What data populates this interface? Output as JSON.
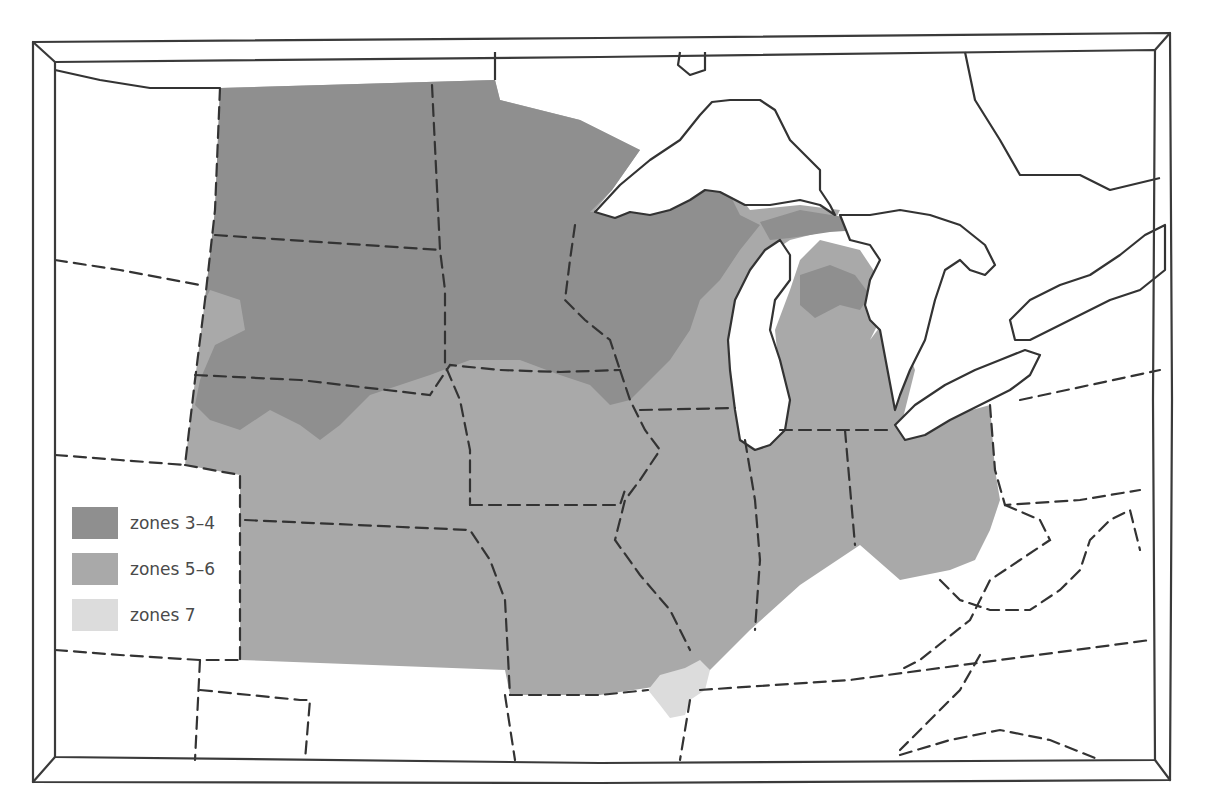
{
  "map": {
    "colors": {
      "zones_3_4": "#8f8f8f",
      "zones_5_6": "#a9a9a9",
      "zones_7": "#dcdcdc",
      "water": "#ffffff",
      "outline": "#333333"
    }
  },
  "legend": {
    "items": [
      {
        "label": "zones 3–4",
        "color": "#8f8f8f"
      },
      {
        "label": "zones 5–6",
        "color": "#a9a9a9"
      },
      {
        "label": "zones 7",
        "color": "#dcdcdc"
      }
    ]
  }
}
